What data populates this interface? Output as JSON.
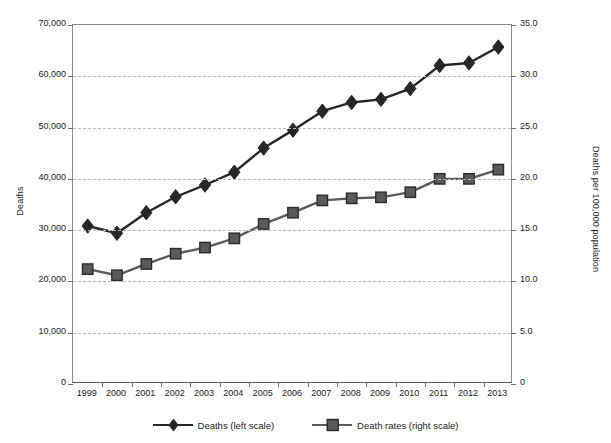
{
  "chart_data": {
    "type": "line",
    "title": "",
    "xlabel": "",
    "categories": [
      "1999",
      "2000",
      "2001",
      "2002",
      "2003",
      "2004",
      "2005",
      "2006",
      "2007",
      "2008",
      "2009",
      "2010",
      "2011",
      "2012",
      "2013"
    ],
    "grid": true,
    "legend_position": "bottom",
    "series": [
      {
        "name": "Deaths (left scale)",
        "marker": "diamond",
        "axis": "left",
        "color": "#262626",
        "values": [
          30800,
          29400,
          33400,
          36500,
          38800,
          41300,
          46000,
          49500,
          53200,
          54900,
          55500,
          57600,
          62100,
          62600,
          65700
        ]
      },
      {
        "name": "Death rates (right scale)",
        "marker": "square",
        "axis": "right",
        "color": "#5a5a5a",
        "values": [
          11.2,
          10.6,
          11.7,
          12.7,
          13.3,
          14.2,
          15.6,
          16.7,
          17.9,
          18.1,
          18.2,
          18.7,
          20.0,
          20.0,
          20.9
        ]
      }
    ],
    "left_axis": {
      "label": "Deaths",
      "ylim": [
        0,
        70000
      ],
      "ticks": [
        0,
        10000,
        20000,
        30000,
        40000,
        50000,
        60000,
        70000
      ],
      "tick_labels": [
        "0",
        "10,000",
        "20,000",
        "30,000",
        "40,000",
        "50,000",
        "60,000",
        "70,000"
      ]
    },
    "right_axis": {
      "label": "Deaths per 100,000 population",
      "ylim": [
        0,
        35
      ],
      "ticks": [
        0,
        5,
        10,
        15,
        20,
        25,
        30,
        35
      ],
      "tick_labels": [
        "0",
        "5.0",
        "10.0",
        "15.0",
        "20.0",
        "25.0",
        "30.0",
        "35.0"
      ]
    },
    "legend": [
      {
        "label": "Deaths (left scale)",
        "marker": "diamond",
        "color": "#262626"
      },
      {
        "label": "Death rates (right scale)",
        "marker": "square",
        "color": "#5a5a5a"
      }
    ]
  }
}
